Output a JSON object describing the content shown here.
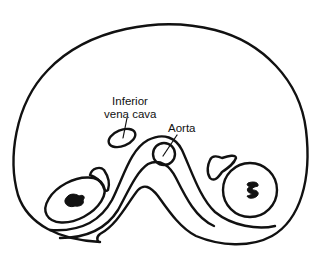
{
  "figure": {
    "type": "anatomical cross-section line drawing",
    "labels": {
      "ivc_line1": "Inferior",
      "ivc_line2": "vena cava",
      "aorta": "Aorta"
    },
    "colors": {
      "line": "#111111",
      "background": "#ffffff"
    }
  }
}
